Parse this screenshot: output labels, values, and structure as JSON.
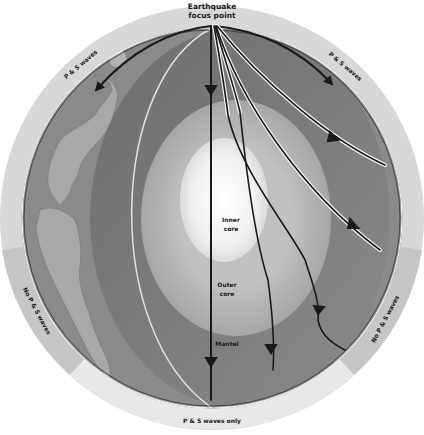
{
  "diagram": {
    "labels": {
      "focus": [
        "Earthquake",
        "focus point"
      ],
      "inner_core": [
        "Inner",
        "core"
      ],
      "outer_core": [
        "Outer",
        "core"
      ],
      "mantle": "Mantel",
      "ps_waves_left": "P & S waves",
      "ps_waves_right": "P & S waves",
      "no_ps_left": "No P & S waves",
      "no_ps_right": "No P & S waves",
      "ps_only_bottom": "P & S waves only"
    },
    "colors": {
      "outer_ring": "#d6d6d6",
      "shadow_zone": "#c4c4c4",
      "mantle": "#7d7d7d",
      "outer_core": "#b4b4b4",
      "inner_core": "#f4f4f4",
      "continent": "#a9a9a9",
      "wave_line": "#1a1a1a"
    }
  }
}
